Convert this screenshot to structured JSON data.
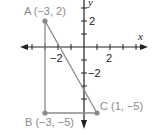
{
  "diagram": {
    "type": "coordinate-plane-triangle",
    "axes": {
      "x_label": "x",
      "y_label": "y",
      "x_tick_labels": [
        {
          "value": -2,
          "text": "−2"
        },
        {
          "value": 2,
          "text": "2"
        }
      ],
      "y_tick_labels": [
        {
          "value": 2,
          "text": "2"
        },
        {
          "value": -2,
          "text": "−2"
        }
      ]
    },
    "points": [
      {
        "name": "A",
        "x": -3,
        "y": 2,
        "label": "A (−3, 2)"
      },
      {
        "name": "B",
        "x": -3,
        "y": -5,
        "label": "B (−3, −5)"
      },
      {
        "name": "C",
        "x": 1,
        "y": -5,
        "label": "C (1, −5)"
      }
    ],
    "colors": {
      "axis": "#222222",
      "triangle": "#8a8a8a",
      "point": "#8a8a8a",
      "label": "#8a8a8a"
    }
  }
}
